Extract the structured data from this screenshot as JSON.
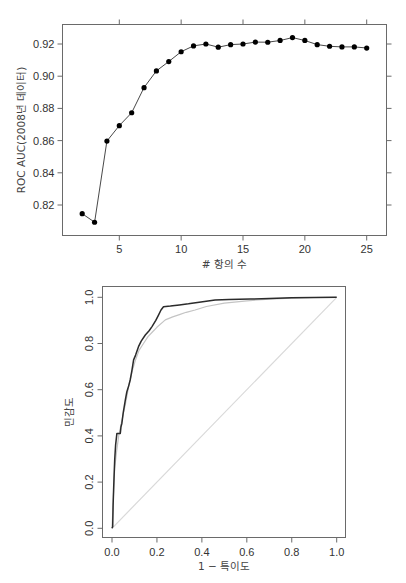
{
  "chart_data": [
    {
      "type": "line",
      "title": "",
      "xlabel": "# 항의 수",
      "ylabel": "ROC AUC(2008년 데이터)",
      "xlim": [
        1.2,
        26.0
      ],
      "ylim": [
        0.804,
        0.933
      ],
      "x_ticks": [
        5,
        10,
        15,
        20,
        25
      ],
      "x_tick_labels": [
        "5",
        "10",
        "15",
        "20",
        "25"
      ],
      "y_ticks": [
        0.82,
        0.84,
        0.86,
        0.88,
        0.9,
        0.92
      ],
      "y_tick_labels": [
        "0.82",
        "0.84",
        "0.86",
        "0.88",
        "0.90",
        "0.92"
      ],
      "grid": false,
      "ticks_all_sides": true,
      "marker": "filled-circle",
      "series": [
        {
          "name": "ROC AUC",
          "x": [
            2,
            3,
            4,
            5,
            6,
            7,
            8,
            9,
            10,
            11,
            12,
            13,
            14,
            15,
            16,
            17,
            18,
            19,
            20,
            21,
            22,
            23,
            24,
            25
          ],
          "values": [
            0.8146,
            0.8093,
            0.8597,
            0.8693,
            0.8773,
            0.8929,
            0.9033,
            0.9091,
            0.9152,
            0.9188,
            0.92,
            0.918,
            0.9196,
            0.92,
            0.9212,
            0.9211,
            0.9222,
            0.924,
            0.9222,
            0.9196,
            0.9186,
            0.9182,
            0.9182,
            0.9175
          ]
        }
      ]
    },
    {
      "type": "line",
      "title": "",
      "xlabel": "1 − 특이도",
      "ylabel": "민감도",
      "xlim": [
        -0.04,
        1.04
      ],
      "ylim": [
        -0.04,
        1.04
      ],
      "x_ticks": [
        0.0,
        0.2,
        0.4,
        0.6,
        0.8,
        1.0
      ],
      "x_tick_labels": [
        "0.0",
        "0.2",
        "0.4",
        "0.6",
        "0.8",
        "1.0"
      ],
      "y_ticks": [
        0.0,
        0.2,
        0.4,
        0.6,
        0.8,
        1.0
      ],
      "y_tick_labels": [
        "0.0",
        "0.2",
        "0.4",
        "0.6",
        "0.8",
        "1.0"
      ],
      "grid": false,
      "series": [
        {
          "name": "ROC (dark)",
          "color": "#2b2b2b",
          "x": [
            0.0,
            0.003,
            0.005,
            0.007,
            0.01,
            0.012,
            0.016,
            0.022,
            0.037,
            0.04,
            0.044,
            0.05,
            0.059,
            0.066,
            0.075,
            0.081,
            0.088,
            0.096,
            0.105,
            0.118,
            0.13,
            0.148,
            0.165,
            0.178,
            0.195,
            0.207,
            0.218,
            0.229,
            0.26,
            0.3,
            0.34,
            0.38,
            0.459,
            0.52,
            0.615,
            0.7,
            0.8,
            0.9,
            1.0
          ],
          "values": [
            0.0,
            0.007,
            0.1,
            0.166,
            0.24,
            0.296,
            0.36,
            0.411,
            0.411,
            0.44,
            0.455,
            0.5,
            0.555,
            0.59,
            0.62,
            0.642,
            0.68,
            0.729,
            0.75,
            0.786,
            0.81,
            0.837,
            0.855,
            0.873,
            0.9,
            0.923,
            0.945,
            0.959,
            0.962,
            0.967,
            0.972,
            0.978,
            0.988,
            0.99,
            0.992,
            0.995,
            0.998,
            0.999,
            1.0
          ]
        },
        {
          "name": "ROC (gray)",
          "color": "#c4c4c4",
          "x": [
            0.0,
            0.004,
            0.008,
            0.012,
            0.02,
            0.03,
            0.045,
            0.06,
            0.075,
            0.09,
            0.105,
            0.12,
            0.14,
            0.16,
            0.18,
            0.2,
            0.237,
            0.27,
            0.3,
            0.33,
            0.37,
            0.42,
            0.5,
            0.6,
            0.7,
            0.8,
            0.9,
            1.0
          ],
          "values": [
            0.0,
            0.08,
            0.18,
            0.26,
            0.33,
            0.4,
            0.47,
            0.54,
            0.62,
            0.68,
            0.73,
            0.77,
            0.8,
            0.83,
            0.85,
            0.87,
            0.902,
            0.915,
            0.925,
            0.935,
            0.945,
            0.96,
            0.975,
            0.985,
            0.992,
            0.996,
            0.999,
            1.0
          ]
        },
        {
          "name": "Reference diagonal",
          "color": "#d9d9d9",
          "x": [
            0.0,
            1.0
          ],
          "values": [
            0.0,
            1.0
          ]
        }
      ]
    }
  ]
}
